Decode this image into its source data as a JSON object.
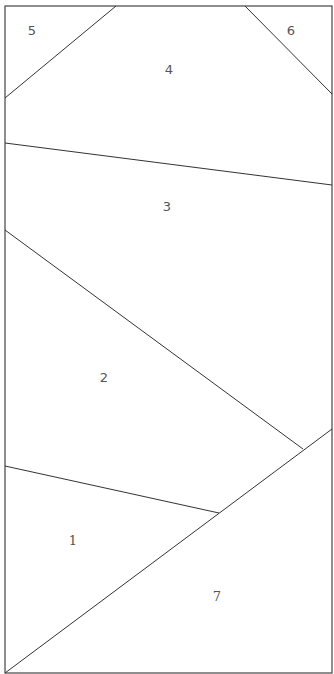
{
  "diagram": {
    "type": "polygon-partition",
    "width": 334,
    "height": 674,
    "stroke_color": "#333333",
    "label_color": "#555555",
    "frame": {
      "x1": 5,
      "y1": 6,
      "x2": 332,
      "y2": 673
    },
    "edges": [
      {
        "name": "edge-5-4",
        "x1": 5,
        "y1": 98,
        "x2": 116,
        "y2": 6
      },
      {
        "name": "edge-4-6",
        "x1": 245,
        "y1": 6,
        "x2": 332,
        "y2": 94
      },
      {
        "name": "edge-4-3",
        "x1": 5,
        "y1": 143,
        "x2": 332,
        "y2": 185
      },
      {
        "name": "edge-3-2",
        "x1": 5,
        "y1": 230,
        "x2": 303,
        "y2": 449
      },
      {
        "name": "edge-2-1",
        "x1": 5,
        "y1": 466,
        "x2": 219,
        "y2": 513
      },
      {
        "name": "edge-1-7",
        "x1": 5,
        "y1": 673,
        "x2": 332,
        "y2": 429
      }
    ],
    "regions": [
      {
        "id": "5",
        "label": "5",
        "x": 32,
        "y": 31
      },
      {
        "id": "6",
        "label": "6",
        "x": 291,
        "y": 31
      },
      {
        "id": "4",
        "label": "4",
        "x": 169,
        "y": 70
      },
      {
        "id": "3",
        "label": "3",
        "x": 167,
        "y": 207
      },
      {
        "id": "2",
        "label": "2",
        "x": 104,
        "y": 378
      },
      {
        "id": "1",
        "label": "1",
        "x": 73,
        "y": 541
      },
      {
        "id": "7",
        "label": "7",
        "x": 217,
        "y": 597
      }
    ]
  }
}
